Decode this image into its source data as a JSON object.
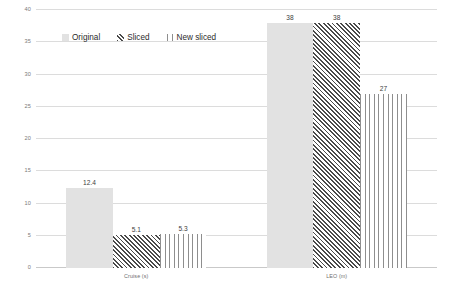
{
  "chart_data": {
    "type": "bar",
    "title": "",
    "subtitle": "",
    "xlabel": "",
    "ylabel": "",
    "ylim": [
      0,
      40
    ],
    "yticks": [
      0,
      5,
      10,
      15,
      20,
      25,
      30,
      35,
      40
    ],
    "ytick_labels": [
      "0",
      "5",
      "10",
      "15",
      "20",
      "25",
      "30",
      "35",
      "40"
    ],
    "grid": true,
    "legend_position": "top-left-inside",
    "categories": [
      "Cruise (s)",
      "LEO (m)"
    ],
    "series": [
      {
        "name": "Original",
        "fill": "solid",
        "color": "#e2e2e2",
        "values": [
          12.4,
          38
        ],
        "labels": [
          "12.4",
          "38"
        ]
      },
      {
        "name": "Sliced",
        "fill": "diagonal-hatch",
        "color": "#4a4a4a",
        "values": [
          5.1,
          38
        ],
        "labels": [
          "5.1",
          "38"
        ]
      },
      {
        "name": "New sliced",
        "fill": "vertical-lines",
        "color": "#8e8e8e",
        "values": [
          5.3,
          27
        ],
        "labels": [
          "5.3",
          "27"
        ]
      }
    ]
  },
  "legend": {
    "items": [
      {
        "label": "Original"
      },
      {
        "label": "Sliced"
      },
      {
        "label": "New sliced"
      }
    ]
  },
  "axis": {
    "y": {
      "ticks": [
        "40",
        "35",
        "30",
        "25",
        "20",
        "15",
        "10",
        "5",
        "0"
      ]
    },
    "x": {
      "categories": [
        "Cruise (s)",
        "LEO (m)"
      ]
    }
  },
  "colors": {
    "background": "#ffffff",
    "gridline": "#dcdcdc",
    "baseline": "#c9c9c9",
    "tick_text": "#7a7a7a",
    "label_text": "#3d3d3d",
    "series_solid": "#e2e2e2",
    "series_hatch": "#4a4a4a",
    "series_vertical": "#8e8e8e"
  }
}
